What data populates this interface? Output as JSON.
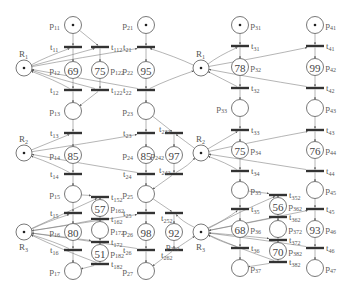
{
  "diagram": {
    "type": "petri-net",
    "resources": [
      {
        "id": "R1",
        "label": "R",
        "sub": "1",
        "instances": [
          {
            "x": 24,
            "y": 68
          },
          {
            "x": 201,
            "y": 68
          }
        ]
      },
      {
        "id": "R2",
        "label": "R",
        "sub": "2",
        "instances": [
          {
            "x": 24,
            "y": 153
          },
          {
            "x": 201,
            "y": 153
          }
        ]
      },
      {
        "id": "R3",
        "label": "R",
        "sub": "3",
        "instances": [
          {
            "x": 24,
            "y": 232
          },
          {
            "x": 201,
            "y": 232
          }
        ]
      }
    ],
    "places": [
      {
        "id": "p11",
        "label": "p",
        "sub": "11",
        "x": 73,
        "y": 25,
        "token": true,
        "value": "",
        "label_side": "left"
      },
      {
        "id": "p12",
        "label": "p",
        "sub": "12",
        "x": 73,
        "y": 70,
        "token": false,
        "value": "69",
        "label_side": "left"
      },
      {
        "id": "p13",
        "label": "p",
        "sub": "13",
        "x": 73,
        "y": 111,
        "token": false,
        "value": "",
        "label_side": "left"
      },
      {
        "id": "p14",
        "label": "p",
        "sub": "14",
        "x": 73,
        "y": 155,
        "token": false,
        "value": "85",
        "label_side": "left"
      },
      {
        "id": "p15",
        "label": "p",
        "sub": "15",
        "x": 73,
        "y": 194,
        "token": false,
        "value": "",
        "label_side": "left"
      },
      {
        "id": "p16",
        "label": "p",
        "sub": "16",
        "x": 73,
        "y": 232,
        "token": false,
        "value": "80",
        "label_side": "left"
      },
      {
        "id": "p17",
        "label": "p",
        "sub": "17",
        "x": 73,
        "y": 271,
        "token": false,
        "value": "",
        "label_side": "left"
      },
      {
        "id": "p122",
        "label": "p",
        "sub": "122",
        "x": 100,
        "y": 70,
        "token": false,
        "value": "75",
        "label_side": "right"
      },
      {
        "id": "p162",
        "label": "p",
        "sub": "162",
        "x": 100,
        "y": 208,
        "token": false,
        "value": "57",
        "label_side": "right"
      },
      {
        "id": "p172",
        "label": "p",
        "sub": "172",
        "x": 100,
        "y": 230,
        "token": false,
        "value": "",
        "label_side": "right"
      },
      {
        "id": "p182",
        "label": "p",
        "sub": "182",
        "x": 100,
        "y": 253,
        "token": false,
        "value": "51",
        "label_side": "right"
      },
      {
        "id": "p21",
        "label": "p",
        "sub": "21",
        "x": 146,
        "y": 25,
        "token": true,
        "value": "",
        "label_side": "left"
      },
      {
        "id": "p22",
        "label": "p",
        "sub": "22",
        "x": 146,
        "y": 70,
        "token": false,
        "value": "95",
        "label_side": "left"
      },
      {
        "id": "p23",
        "label": "p",
        "sub": "23",
        "x": 146,
        "y": 111,
        "token": false,
        "value": "",
        "label_side": "left"
      },
      {
        "id": "p24",
        "label": "p",
        "sub": "24",
        "x": 146,
        "y": 155,
        "token": false,
        "value": "85",
        "label_side": "left"
      },
      {
        "id": "p25",
        "label": "p",
        "sub": "25",
        "x": 146,
        "y": 194,
        "token": false,
        "value": "",
        "label_side": "left"
      },
      {
        "id": "p26",
        "label": "p",
        "sub": "26",
        "x": 146,
        "y": 232,
        "token": false,
        "value": "98",
        "label_side": "left"
      },
      {
        "id": "p27",
        "label": "p",
        "sub": "27",
        "x": 146,
        "y": 271,
        "token": false,
        "value": "",
        "label_side": "left"
      },
      {
        "id": "p242",
        "label": "p",
        "sub": "242",
        "x": 174,
        "y": 155,
        "token": false,
        "value": "97",
        "label_side": "left"
      },
      {
        "id": "p262",
        "label": "p",
        "sub": "262",
        "x": 174,
        "y": 232,
        "token": false,
        "value": "92",
        "label_side": "below"
      },
      {
        "id": "p31",
        "label": "p",
        "sub": "31",
        "x": 240,
        "y": 25,
        "token": true,
        "value": "",
        "label_side": "right"
      },
      {
        "id": "p32",
        "label": "p",
        "sub": "32",
        "x": 240,
        "y": 67,
        "token": false,
        "value": "78",
        "label_side": "right"
      },
      {
        "id": "p33",
        "label": "p",
        "sub": "33",
        "x": 240,
        "y": 108,
        "token": false,
        "value": "",
        "label_side": "left"
      },
      {
        "id": "p34",
        "label": "p",
        "sub": "34",
        "x": 240,
        "y": 150,
        "token": false,
        "value": "75",
        "label_side": "right"
      },
      {
        "id": "p35",
        "label": "p",
        "sub": "35",
        "x": 240,
        "y": 190,
        "token": false,
        "value": "",
        "label_side": "right"
      },
      {
        "id": "p36",
        "label": "p",
        "sub": "36",
        "x": 240,
        "y": 229,
        "token": false,
        "value": "68",
        "label_side": "right"
      },
      {
        "id": "p37",
        "label": "p",
        "sub": "37",
        "x": 240,
        "y": 268,
        "token": false,
        "value": "",
        "label_side": "right"
      },
      {
        "id": "p362",
        "label": "p",
        "sub": "362",
        "x": 278,
        "y": 206,
        "token": false,
        "value": "56",
        "label_side": "right"
      },
      {
        "id": "p372",
        "label": "p",
        "sub": "372",
        "x": 278,
        "y": 229,
        "token": false,
        "value": "",
        "label_side": "right"
      },
      {
        "id": "p382",
        "label": "p",
        "sub": "382",
        "x": 278,
        "y": 251,
        "token": false,
        "value": "70",
        "label_side": "right"
      },
      {
        "id": "p41",
        "label": "p",
        "sub": "41",
        "x": 315,
        "y": 25,
        "token": true,
        "value": "",
        "label_side": "right"
      },
      {
        "id": "p42",
        "label": "p",
        "sub": "42",
        "x": 315,
        "y": 67,
        "token": false,
        "value": "99",
        "label_side": "right"
      },
      {
        "id": "p43",
        "label": "p",
        "sub": "43",
        "x": 315,
        "y": 108,
        "token": false,
        "value": "",
        "label_side": "right"
      },
      {
        "id": "p44",
        "label": "p",
        "sub": "44",
        "x": 315,
        "y": 150,
        "token": false,
        "value": "76",
        "label_side": "right"
      },
      {
        "id": "p45",
        "label": "p",
        "sub": "45",
        "x": 315,
        "y": 190,
        "token": false,
        "value": "",
        "label_side": "right"
      },
      {
        "id": "p46",
        "label": "p",
        "sub": "46",
        "x": 315,
        "y": 229,
        "token": false,
        "value": "93",
        "label_side": "right"
      },
      {
        "id": "p47",
        "label": "p",
        "sub": "47",
        "x": 315,
        "y": 268,
        "token": false,
        "value": "",
        "label_side": "right"
      }
    ],
    "transitions": [
      {
        "id": "t11",
        "label": "t",
        "sub": "11",
        "x": 73,
        "y": 47,
        "label_side": "left"
      },
      {
        "id": "t12",
        "label": "t",
        "sub": "12",
        "x": 73,
        "y": 90,
        "label_side": "left"
      },
      {
        "id": "t13",
        "label": "t",
        "sub": "13",
        "x": 73,
        "y": 133,
        "label_side": "left"
      },
      {
        "id": "t14",
        "label": "t",
        "sub": "14",
        "x": 73,
        "y": 174,
        "label_side": "left"
      },
      {
        "id": "t15",
        "label": "t",
        "sub": "15",
        "x": 73,
        "y": 213,
        "label_side": "left"
      },
      {
        "id": "t16",
        "label": "t",
        "sub": "16",
        "x": 73,
        "y": 250,
        "label_side": "left"
      },
      {
        "id": "t112",
        "label": "t",
        "sub": "112",
        "x": 100,
        "y": 47,
        "label_side": "right"
      },
      {
        "id": "t122",
        "label": "t",
        "sub": "122",
        "x": 100,
        "y": 90,
        "label_side": "right"
      },
      {
        "id": "t152",
        "label": "t",
        "sub": "152",
        "x": 100,
        "y": 197,
        "label_side": "right"
      },
      {
        "id": "t162",
        "label": "t",
        "sub": "162",
        "x": 100,
        "y": 219,
        "label_side": "right"
      },
      {
        "id": "t172",
        "label": "t",
        "sub": "172",
        "x": 100,
        "y": 242,
        "label_side": "right"
      },
      {
        "id": "t182",
        "label": "t",
        "sub": "182",
        "x": 100,
        "y": 264,
        "label_side": "right"
      },
      {
        "id": "t21",
        "label": "t",
        "sub": "21",
        "x": 146,
        "y": 47,
        "label_side": "left"
      },
      {
        "id": "t22",
        "label": "t",
        "sub": "22",
        "x": 146,
        "y": 90,
        "label_side": "left"
      },
      {
        "id": "t23",
        "label": "t",
        "sub": "23",
        "x": 146,
        "y": 133,
        "label_side": "left"
      },
      {
        "id": "t24",
        "label": "t",
        "sub": "24",
        "x": 146,
        "y": 174,
        "label_side": "left"
      },
      {
        "id": "t25",
        "label": "t",
        "sub": "25",
        "x": 146,
        "y": 213,
        "label_side": "left"
      },
      {
        "id": "t26",
        "label": "t",
        "sub": "26",
        "x": 146,
        "y": 250,
        "label_side": "left"
      },
      {
        "id": "t232",
        "label": "t",
        "sub": "232",
        "x": 174,
        "y": 133,
        "label_side": "left-up"
      },
      {
        "id": "t242",
        "label": "t",
        "sub": "242",
        "x": 174,
        "y": 174,
        "label_side": "left-up"
      },
      {
        "id": "t252",
        "label": "t",
        "sub": "252",
        "x": 174,
        "y": 213,
        "label_side": "left-down"
      },
      {
        "id": "t262",
        "label": "t",
        "sub": "262",
        "x": 174,
        "y": 250,
        "label_side": "left-down"
      },
      {
        "id": "t31",
        "label": "t",
        "sub": "31",
        "x": 240,
        "y": 46,
        "label_side": "right"
      },
      {
        "id": "t32",
        "label": "t",
        "sub": "32",
        "x": 240,
        "y": 88,
        "label_side": "right"
      },
      {
        "id": "t33",
        "label": "t",
        "sub": "33",
        "x": 240,
        "y": 130,
        "label_side": "right"
      },
      {
        "id": "t34",
        "label": "t",
        "sub": "34",
        "x": 240,
        "y": 171,
        "label_side": "right"
      },
      {
        "id": "t35",
        "label": "t",
        "sub": "35",
        "x": 240,
        "y": 209,
        "label_side": "right"
      },
      {
        "id": "t36",
        "label": "t",
        "sub": "36",
        "x": 240,
        "y": 248,
        "label_side": "right"
      },
      {
        "id": "t352",
        "label": "t",
        "sub": "352",
        "x": 278,
        "y": 195,
        "label_side": "right"
      },
      {
        "id": "t362",
        "label": "t",
        "sub": "362",
        "x": 278,
        "y": 217,
        "label_side": "right"
      },
      {
        "id": "t372",
        "label": "t",
        "sub": "372",
        "x": 278,
        "y": 240,
        "label_side": "right"
      },
      {
        "id": "t382",
        "label": "t",
        "sub": "382",
        "x": 278,
        "y": 262,
        "label_side": "right"
      },
      {
        "id": "t41",
        "label": "t",
        "sub": "41",
        "x": 315,
        "y": 46,
        "label_side": "right"
      },
      {
        "id": "t42",
        "label": "t",
        "sub": "42",
        "x": 315,
        "y": 88,
        "label_side": "right"
      },
      {
        "id": "t43",
        "label": "t",
        "sub": "43",
        "x": 315,
        "y": 130,
        "label_side": "right"
      },
      {
        "id": "t44",
        "label": "t",
        "sub": "44",
        "x": 315,
        "y": 171,
        "label_side": "right"
      },
      {
        "id": "t45",
        "label": "t",
        "sub": "45",
        "x": 315,
        "y": 209,
        "label_side": "right"
      },
      {
        "id": "t46",
        "label": "t",
        "sub": "46",
        "x": 315,
        "y": 248,
        "label_side": "right"
      }
    ],
    "arcs": [
      [
        "p11",
        "t11"
      ],
      [
        "t11",
        "p12"
      ],
      [
        "p12",
        "t12"
      ],
      [
        "t12",
        "p13"
      ],
      [
        "p13",
        "t13"
      ],
      [
        "t13",
        "p14"
      ],
      [
        "p14",
        "t14"
      ],
      [
        "t14",
        "p15"
      ],
      [
        "p15",
        "t15"
      ],
      [
        "t15",
        "p16"
      ],
      [
        "p16",
        "t16"
      ],
      [
        "t16",
        "p17"
      ],
      [
        "p11",
        "t112"
      ],
      [
        "t112",
        "p122"
      ],
      [
        "p122",
        "t122"
      ],
      [
        "t122",
        "p13"
      ],
      [
        "p15",
        "t152"
      ],
      [
        "t152",
        "p162"
      ],
      [
        "p162",
        "t162"
      ],
      [
        "t162",
        "p172"
      ],
      [
        "p172",
        "t172"
      ],
      [
        "t172",
        "p182"
      ],
      [
        "p182",
        "t182"
      ],
      [
        "t182",
        "p17"
      ],
      [
        "p21",
        "t21"
      ],
      [
        "t21",
        "p22"
      ],
      [
        "p22",
        "t22"
      ],
      [
        "t22",
        "p23"
      ],
      [
        "p23",
        "t23"
      ],
      [
        "t23",
        "p24"
      ],
      [
        "p24",
        "t24"
      ],
      [
        "t24",
        "p25"
      ],
      [
        "p25",
        "t25"
      ],
      [
        "t25",
        "p26"
      ],
      [
        "p26",
        "t26"
      ],
      [
        "t26",
        "p27"
      ],
      [
        "p23",
        "t232"
      ],
      [
        "t232",
        "p242"
      ],
      [
        "p242",
        "t242"
      ],
      [
        "t242",
        "p25"
      ],
      [
        "p25",
        "t252"
      ],
      [
        "t252",
        "p262"
      ],
      [
        "p262",
        "t262"
      ],
      [
        "t262",
        "p27"
      ],
      [
        "p31",
        "t31"
      ],
      [
        "t31",
        "p32"
      ],
      [
        "p32",
        "t32"
      ],
      [
        "t32",
        "p33"
      ],
      [
        "p33",
        "t33"
      ],
      [
        "t33",
        "p34"
      ],
      [
        "p34",
        "t34"
      ],
      [
        "t34",
        "p35"
      ],
      [
        "p35",
        "t35"
      ],
      [
        "t35",
        "p36"
      ],
      [
        "p36",
        "t36"
      ],
      [
        "t36",
        "p37"
      ],
      [
        "p35",
        "t352"
      ],
      [
        "t352",
        "p362"
      ],
      [
        "p362",
        "t362"
      ],
      [
        "t362",
        "p372"
      ],
      [
        "p372",
        "t372"
      ],
      [
        "t372",
        "p382"
      ],
      [
        "p382",
        "t382"
      ],
      [
        "t382",
        "p37"
      ],
      [
        "p41",
        "t41"
      ],
      [
        "t41",
        "p42"
      ],
      [
        "p42",
        "t42"
      ],
      [
        "t42",
        "p43"
      ],
      [
        "p43",
        "t43"
      ],
      [
        "t43",
        "p44"
      ],
      [
        "p44",
        "t44"
      ],
      [
        "t44",
        "p45"
      ],
      [
        "p45",
        "t45"
      ],
      [
        "t45",
        "p46"
      ],
      [
        "p46",
        "t46"
      ],
      [
        "t46",
        "p47"
      ]
    ],
    "resource_arcs": [
      [
        "R1L",
        "t11"
      ],
      [
        "R1L",
        "t112"
      ],
      [
        "t12",
        "R1L"
      ],
      [
        "t122",
        "R1L"
      ],
      [
        "R2L",
        "t13"
      ],
      [
        "t14",
        "R2L"
      ],
      [
        "R3L",
        "t15"
      ],
      [
        "R3L",
        "t152"
      ],
      [
        "t16",
        "R3L"
      ],
      [
        "t182",
        "R3L"
      ],
      [
        "R3L",
        "t172"
      ],
      [
        "t162",
        "R3L"
      ],
      [
        "R1L",
        "t21"
      ],
      [
        "t22",
        "R1L"
      ],
      [
        "R2L",
        "t23"
      ],
      [
        "t24",
        "R2L"
      ],
      [
        "R3L",
        "t25"
      ],
      [
        "t26",
        "R3L"
      ],
      [
        "R1M",
        "t31"
      ],
      [
        "t32",
        "R1M"
      ],
      [
        "R1M",
        "t41"
      ],
      [
        "t42",
        "R1M"
      ],
      [
        "R2M",
        "t33"
      ],
      [
        "t34",
        "R2M"
      ],
      [
        "R2M",
        "t43"
      ],
      [
        "t44",
        "R2M"
      ],
      [
        "R3M",
        "t35"
      ],
      [
        "t36",
        "R3M"
      ],
      [
        "R3M",
        "t45"
      ],
      [
        "t46",
        "R3M"
      ],
      [
        "R3M",
        "t352"
      ],
      [
        "t362",
        "R3M"
      ],
      [
        "R3M",
        "t372"
      ],
      [
        "t382",
        "R3M"
      ],
      [
        "R2M",
        "t232"
      ],
      [
        "t242",
        "R2M"
      ],
      [
        "R3M",
        "t252"
      ],
      [
        "t262",
        "R3M"
      ],
      [
        "R1M",
        "t21"
      ],
      [
        "t22",
        "R1M"
      ]
    ]
  }
}
